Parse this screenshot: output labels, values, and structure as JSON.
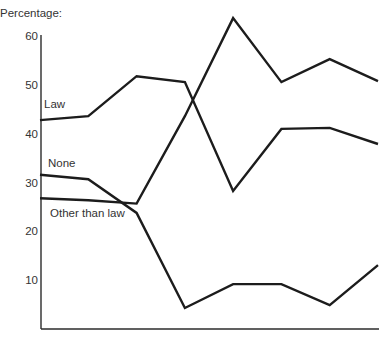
{
  "chart_data": {
    "type": "line",
    "title": "",
    "xlabel": "",
    "ylabel": "Percentage:",
    "ylim": [
      0,
      60
    ],
    "yticks": [
      10,
      20,
      30,
      40,
      50,
      60
    ],
    "ytick_labels": [
      "10",
      "20",
      "30",
      "40",
      "50",
      "60"
    ],
    "x": [
      1,
      2,
      3,
      4,
      5,
      6,
      7,
      8
    ],
    "xtick_labels": [],
    "grid": false,
    "legend": "inline-labels-left",
    "series": [
      {
        "name": "Law",
        "values": [
          42.8,
          43.6,
          51.8,
          50.6,
          28.3,
          41.0,
          41.2,
          37.9
        ]
      },
      {
        "name": "None",
        "values": [
          31.6,
          30.7,
          23.8,
          4.3,
          9.2,
          9.2,
          4.9,
          13.1
        ]
      },
      {
        "name": "Other than law",
        "values": [
          26.8,
          26.4,
          25.7,
          43.6,
          63.7,
          50.6,
          55.3,
          50.8
        ]
      }
    ]
  }
}
